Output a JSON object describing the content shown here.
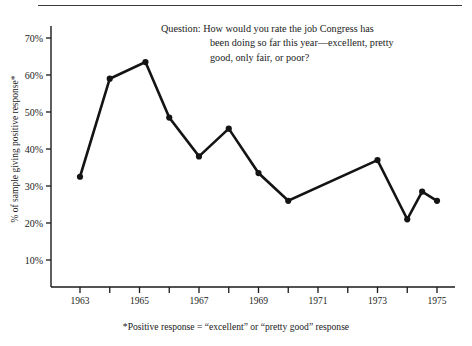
{
  "figure": {
    "question_lines": [
      "Question: How would you rate the job Congress has",
      "been doing so far this year—excellent, pretty",
      "good, only fair, or poor?"
    ],
    "footnote": "*Positive response = “excellent” or “pretty good” response"
  },
  "chart_data": {
    "type": "line",
    "title": "",
    "subtitle": "",
    "xlabel": "",
    "ylabel": "% of sample giving positive response*",
    "xlim": [
      1962,
      1976
    ],
    "ylim": [
      5,
      73
    ],
    "grid": false,
    "legend": "none",
    "ytick_values": [
      10,
      20,
      30,
      40,
      50,
      60,
      70
    ],
    "ytick_labels": [
      "10%",
      "20%",
      "30%",
      "40%",
      "50%",
      "60%",
      "70%"
    ],
    "xtick_values": [
      1963,
      1964,
      1965,
      1966,
      1967,
      1968,
      1969,
      1970,
      1971,
      1972,
      1973,
      1974,
      1975
    ],
    "xtick_labels": [
      "1963",
      "",
      "1965",
      "",
      "1967",
      "",
      "1969",
      "",
      "1971",
      "",
      "1973",
      "",
      "1975"
    ],
    "series": [
      {
        "name": "Positive response",
        "color": "#141414",
        "marker": "circle",
        "x": [
          1963,
          1964,
          1965.2,
          1966,
          1967,
          1968,
          1969,
          1970,
          1973,
          1974,
          1974.5,
          1975
        ],
        "values": [
          32.5,
          59,
          63.5,
          48.5,
          38,
          45.5,
          33.5,
          26,
          37,
          21,
          28.5,
          26
        ]
      }
    ]
  }
}
